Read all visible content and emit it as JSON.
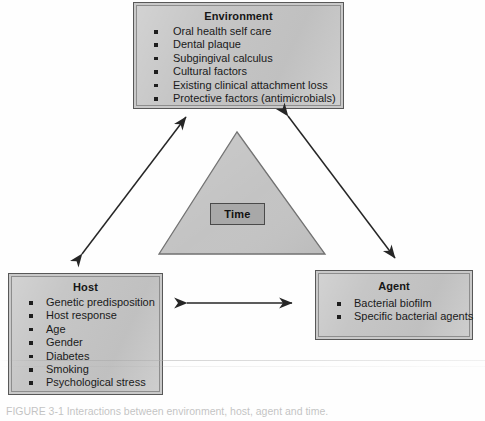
{
  "figure": {
    "type": "epidemiologic-triangle",
    "caption": "FIGURE 3-1  Interactions between environment, host, agent and time."
  },
  "colors": {
    "box_fill": "#c6c6c6",
    "box_border": "#585858",
    "box_inner_border": "#8d8d8d",
    "triangle_fill": "#c2c2c2",
    "triangle_stroke": "#6f6f6f",
    "time_fill": "#a8a8a8",
    "time_border": "#4a4a4a",
    "arrow": "#262626",
    "text": "#1a1a1a"
  },
  "environment": {
    "title": "Environment",
    "items": [
      "Oral health self care",
      "Dental plaque",
      "Subgingival calculus",
      "Cultural factors",
      "Existing clinical attachment loss",
      "Protective factors (antimicrobials)"
    ]
  },
  "host": {
    "title": "Host",
    "items": [
      "Genetic predisposition",
      "Host response",
      "Age",
      "Gender",
      "Diabetes",
      "Smoking",
      "Psychological stress"
    ]
  },
  "agent": {
    "title": "Agent",
    "items": [
      "Bacterial biofilm",
      "Specific bacterial agents"
    ]
  },
  "center": {
    "label": "Time"
  },
  "connectors": [
    {
      "name": "host-environment",
      "style": "double-headed-arrow",
      "orientation": "diagonal-up-right"
    },
    {
      "name": "environment-agent",
      "style": "double-headed-arrow",
      "orientation": "diagonal-down-right"
    },
    {
      "name": "host-agent",
      "style": "double-headed-arrow",
      "orientation": "horizontal"
    }
  ]
}
